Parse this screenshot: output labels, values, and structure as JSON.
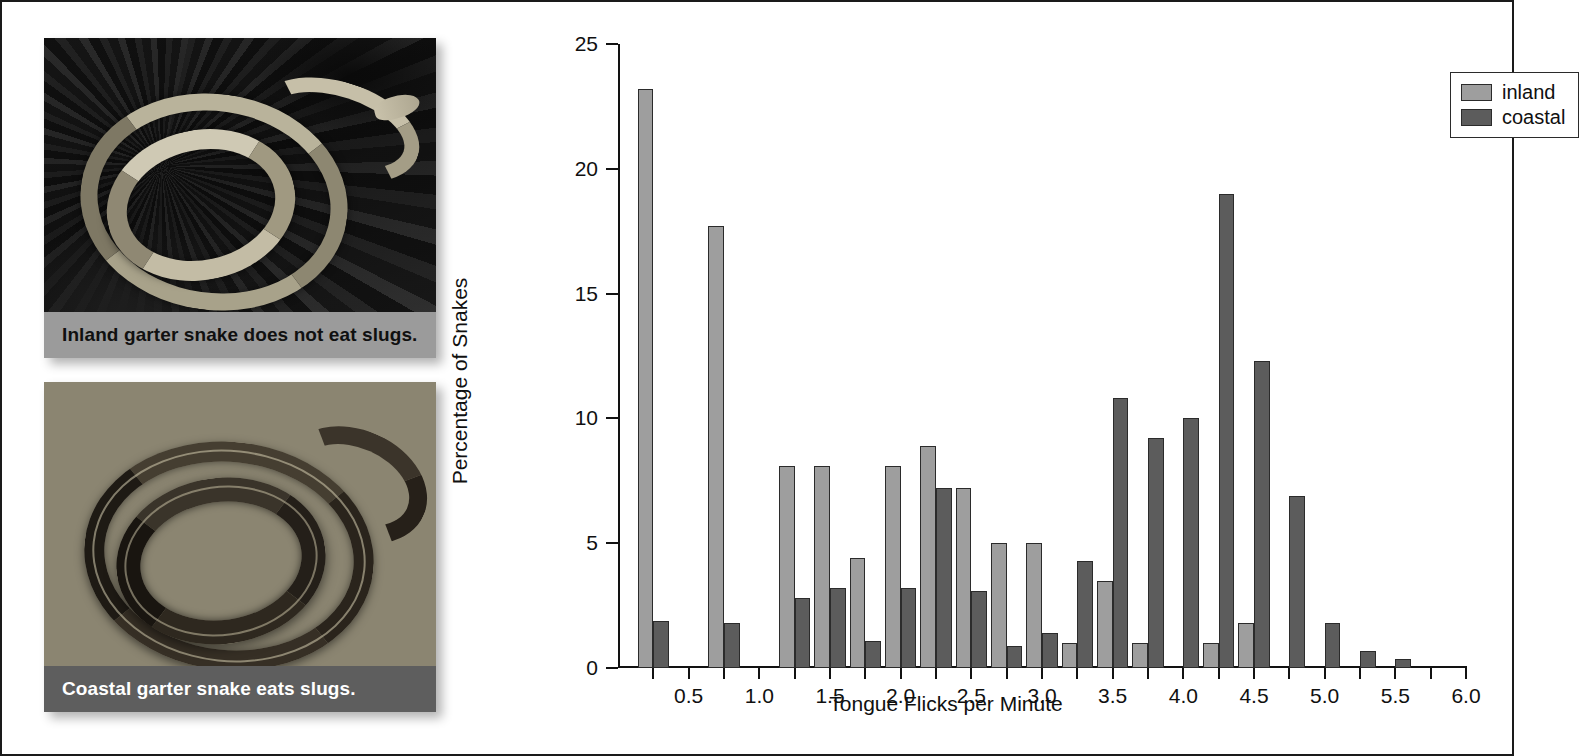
{
  "photos": [
    {
      "id": "inland",
      "caption": "Inland garter snake does not eat slugs.",
      "caption_bg": "#9b9b9b",
      "caption_color": "#101010"
    },
    {
      "id": "coastal",
      "caption": "Coastal garter snake eats slugs.",
      "caption_bg": "#5e5e5e",
      "caption_color": "#ffffff"
    }
  ],
  "legend": {
    "position": "top-right",
    "entries": [
      {
        "label": "inland",
        "color": "#9e9e9e"
      },
      {
        "label": "coastal",
        "color": "#5c5c5c"
      }
    ]
  },
  "chart_data": {
    "type": "bar",
    "title": "",
    "xlabel": "Tongue Flicks per Minute",
    "ylabel": "Percentage of Snakes",
    "xlim": [
      0,
      6.0
    ],
    "ylim": [
      0,
      25
    ],
    "ytick_labels": [
      "0",
      "5",
      "10",
      "15",
      "20",
      "25"
    ],
    "yticks": [
      0,
      5,
      10,
      15,
      20,
      25
    ],
    "xtick_labels": [
      "0.5",
      "1.0",
      "1.5",
      "2.0",
      "2.5",
      "3.0",
      "3.5",
      "4.0",
      "4.5",
      "5.0",
      "5.5",
      "6.0"
    ],
    "xticks": [
      0.5,
      1.0,
      1.5,
      2.0,
      2.5,
      3.0,
      3.5,
      4.0,
      4.5,
      5.0,
      5.5,
      6.0
    ],
    "minor_xtick_step": 0.25,
    "grid": false,
    "bin_width": 0.25,
    "categories": [
      0.25,
      0.5,
      0.75,
      1.0,
      1.25,
      1.5,
      1.75,
      2.0,
      2.25,
      2.5,
      2.75,
      3.0,
      3.25,
      3.5,
      3.75,
      4.0,
      4.25,
      4.5,
      4.75,
      5.0,
      5.25,
      5.5
    ],
    "series": [
      {
        "name": "inland",
        "color": "#9e9e9e",
        "values": [
          23.2,
          0,
          17.7,
          0,
          8.1,
          8.1,
          4.4,
          8.1,
          8.9,
          7.2,
          5.0,
          5.0,
          1.0,
          3.5,
          1.0,
          0,
          1.0,
          1.8,
          0,
          0,
          0,
          0
        ]
      },
      {
        "name": "coastal",
        "color": "#5c5c5c",
        "values": [
          1.9,
          0,
          1.8,
          0,
          2.8,
          3.2,
          1.1,
          3.2,
          7.2,
          3.1,
          0.9,
          1.4,
          4.3,
          10.8,
          9.2,
          10.0,
          19.0,
          12.3,
          6.9,
          1.8,
          0.7,
          0.35
        ]
      }
    ]
  }
}
